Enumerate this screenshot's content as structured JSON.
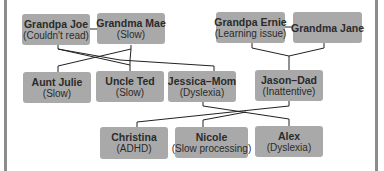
{
  "diagram": {
    "type": "family-tree",
    "line_color": "#222222",
    "box_color": "#a9a9a9",
    "nodes": [
      {
        "id": "grandpa_joe",
        "name": "Grandpa Joe",
        "note": "(Couldn't read)",
        "x": 22,
        "y": 14,
        "w": 68,
        "h": 31
      },
      {
        "id": "grandma_mae",
        "name": "Grandma Mae",
        "note": "(Slow)",
        "x": 97,
        "y": 13,
        "w": 68,
        "h": 31
      },
      {
        "id": "grandpa_ernie",
        "name": "Grandpa Ernie",
        "note": "(Learning issue)",
        "x": 216,
        "y": 12,
        "w": 69,
        "h": 31
      },
      {
        "id": "grandma_jane",
        "name": "Grandma Jane",
        "note": "",
        "x": 293,
        "y": 12,
        "w": 69,
        "h": 31
      },
      {
        "id": "aunt_julie",
        "name": "Aunt Julie",
        "note": "(Slow)",
        "x": 23,
        "y": 72,
        "w": 68,
        "h": 31
      },
      {
        "id": "uncle_ted",
        "name": "Uncle Ted",
        "note": "(Slow)",
        "x": 96,
        "y": 71,
        "w": 68,
        "h": 31
      },
      {
        "id": "jessica_mom",
        "name": "Jessica–Mom",
        "note": "(Dyslexia)",
        "x": 168,
        "y": 71,
        "w": 68,
        "h": 31
      },
      {
        "id": "jason_dad",
        "name": "Jason–Dad",
        "note": "(Inattentive)",
        "x": 255,
        "y": 70,
        "w": 68,
        "h": 31
      },
      {
        "id": "christina",
        "name": "Christina",
        "note": "(ADHD)",
        "x": 100,
        "y": 127,
        "w": 68,
        "h": 32
      },
      {
        "id": "nicole",
        "name": "Nicole",
        "note": "(Slow processing)",
        "x": 175,
        "y": 127,
        "w": 73,
        "h": 31
      },
      {
        "id": "alex",
        "name": "Alex",
        "note": "(Dyslexia)",
        "x": 255,
        "y": 126,
        "w": 68,
        "h": 31
      }
    ],
    "edges": [
      {
        "from": "grandpa_joe",
        "to": "grandma_mae",
        "relation": "spouse"
      },
      {
        "from": "grandpa_ernie",
        "to": "grandma_jane",
        "relation": "spouse"
      },
      {
        "from": "grandpa_joe & grandma_mae",
        "to": "aunt_julie",
        "relation": "child"
      },
      {
        "from": "grandpa_joe & grandma_mae",
        "to": "uncle_ted",
        "relation": "child"
      },
      {
        "from": "grandpa_joe & grandma_mae",
        "to": "jessica_mom",
        "relation": "child"
      },
      {
        "from": "grandpa_ernie & grandma_jane",
        "to": "jason_dad",
        "relation": "child"
      },
      {
        "from": "jessica_mom & jason_dad",
        "to": "christina",
        "relation": "child"
      },
      {
        "from": "jessica_mom & jason_dad",
        "to": "nicole",
        "relation": "child"
      },
      {
        "from": "jessica_mom & jason_dad",
        "to": "alex",
        "relation": "child"
      }
    ]
  }
}
